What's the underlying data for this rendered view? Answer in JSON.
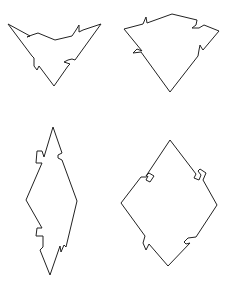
{
  "canvas": {
    "width": 238,
    "height": 291,
    "background": "#ffffff",
    "stroke": "#222222"
  },
  "pieces": [
    {
      "id": "piece-top-left",
      "description": "inverted triangle with jagged tabs",
      "points": "8,24 30,36 27,37 32,35 38,33 55,40 72,36 76,30 79,25 79,32 83,30 101,24 75,60 72,59 68,60 64,62 70,64 68,66 54,86 39,66 37,70 34,66 34,58 32,56"
    },
    {
      "id": "piece-top-right",
      "description": "kite shape with curved tabs",
      "points": "124,29 143,24 146,17 147,23 172,14 197,20 196,25 192,28 199,28 204,25 219,31 203,50 201,47 200,45 199,50 198,56 170,92 141,52 133,53 137,49 142,51"
    },
    {
      "id": "piece-bottom-left",
      "description": "tall diamond with square notches and spikes",
      "points": "53,127 62,153 58,155 58,158 62,160 77,201 66,247 64,245 61,252 60,246 50,275 40,250 43,247 43,236 36,236 37,228 42,228 26,200 42,163 36,163 37,151 42,151 44,157"
    },
    {
      "id": "piece-bottom-right",
      "description": "diamond with square notches and curved tabs",
      "points": "170,140 196,174 194,178 199,180 201,175 198,171 200,169 206,173 203,180 217,205 196,237 188,238 184,242 186,244 190,243 168,266 149,244 146,250 143,243 145,236 121,203 141,177 146,177 148,176 146,180 150,182 154,176 149,173 146,176"
    }
  ]
}
